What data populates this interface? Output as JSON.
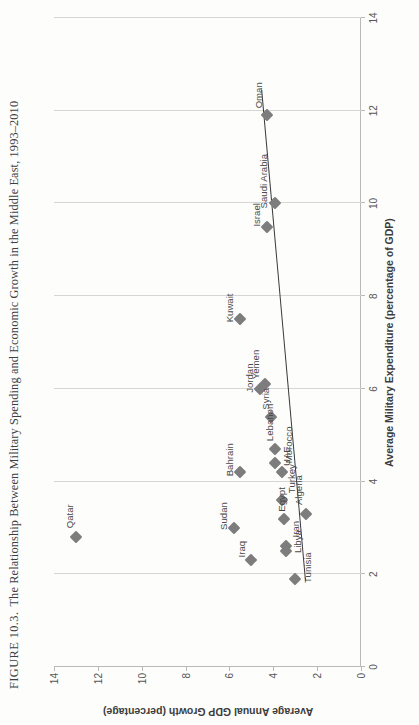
{
  "figure": {
    "number_label": "FIGURE 10.3.",
    "caption": "The Relationship Between Military Spending and Economic Growth in the Middle East, 1993–2010"
  },
  "chart_data": {
    "type": "scatter",
    "title": "The Relationship Between Military Spending and Economic Growth in the Middle East, 1993–2010",
    "xlabel": "Average Military Expenditure (percentage of GDP)",
    "ylabel": "Average Annual GDP Growth (percentage)",
    "xlim": [
      0,
      14
    ],
    "ylim": [
      0,
      14
    ],
    "xticks": [
      0,
      2,
      4,
      6,
      8,
      10,
      12,
      14
    ],
    "yticks": [
      0,
      2,
      4,
      6,
      8,
      10,
      12,
      14
    ],
    "grid": "vertical-only",
    "legend": "none",
    "marker": "diamond",
    "marker_color": "#7d7d7d",
    "trendline": {
      "shown": true,
      "color": "#3a3a3a",
      "x_start": 1.85,
      "y_start": 2.55,
      "x_end": 12.45,
      "y_end": 4.55
    },
    "points": [
      {
        "label": "Qatar",
        "x": 2.8,
        "y": 13.0,
        "label_dx": 9,
        "label_dy": -7
      },
      {
        "label": "Sudan",
        "x": 3.0,
        "y": 5.8,
        "label_dx": -2,
        "label_dy": -11
      },
      {
        "label": "Iraq",
        "x": 2.3,
        "y": 5.0,
        "label_dx": 3,
        "label_dy": -10
      },
      {
        "label": "Kuwait",
        "x": 7.5,
        "y": 5.5,
        "label_dx": -3,
        "label_dy": -11
      },
      {
        "label": "Bahrain",
        "x": 4.2,
        "y": 5.5,
        "label_dx": -4,
        "label_dy": -11
      },
      {
        "label": "Jordan",
        "x": 6.0,
        "y": 4.6,
        "label_dx": -4,
        "label_dy": -11
      },
      {
        "label": "Yemen",
        "x": 6.1,
        "y": 4.4,
        "label_dx": 5,
        "label_dy": -10
      },
      {
        "label": "Israel",
        "x": 9.5,
        "y": 4.3,
        "label_dx": 0,
        "label_dy": -11
      },
      {
        "label": "Oman",
        "x": 11.9,
        "y": 4.3,
        "label_dx": 7,
        "label_dy": -9
      },
      {
        "label": "Saudi Arabia",
        "x": 10.0,
        "y": 3.9,
        "label_dx": -5,
        "label_dy": -12
      },
      {
        "label": "Syria",
        "x": 5.4,
        "y": 4.1,
        "label_dx": 7,
        "label_dy": -6
      },
      {
        "label": "Lebanon",
        "x": 4.7,
        "y": 3.9,
        "label_dx": 8,
        "label_dy": -6
      },
      {
        "label": "UAE",
        "x": 4.4,
        "y": 3.9,
        "label_dx": -3,
        "label_dy": 11
      },
      {
        "label": "Morocco",
        "x": 4.2,
        "y": 3.6,
        "label_dx": 9,
        "label_dy": 6
      },
      {
        "label": "Turkey",
        "x": 3.6,
        "y": 3.6,
        "label_dx": 7,
        "label_dy": 9
      },
      {
        "label": "Egypt",
        "x": 3.2,
        "y": 3.5,
        "label_dx": 7,
        "label_dy": -3
      },
      {
        "label": "Algeria",
        "x": 3.3,
        "y": 2.5,
        "label_dx": 9,
        "label_dy": -8
      },
      {
        "label": "Iran",
        "x": 2.6,
        "y": 3.4,
        "label_dx": 9,
        "label_dy": 9
      },
      {
        "label": "Libya",
        "x": 2.5,
        "y": 3.4,
        "label_dx": -2,
        "label_dy": 11
      },
      {
        "label": "Tunisia",
        "x": 1.9,
        "y": 3.0,
        "label_dx": -4,
        "label_dy": 12
      }
    ]
  }
}
